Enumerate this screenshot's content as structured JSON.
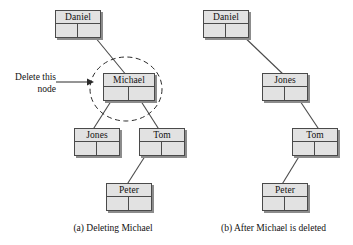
{
  "figure": {
    "background_color": "#ffffff",
    "node_fill_color": "#e2e2e2",
    "node_border_color": "#4a4a4a",
    "shadow_color": "#8c8c8c",
    "line_color": "#4a4a4a"
  },
  "annotation": {
    "line1": "Delete this",
    "line2": "node"
  },
  "panels": [
    {
      "id": "panel-a",
      "caption": "(a) Deleting Michael",
      "highlight": {
        "shape": "dashed-ellipse",
        "target": "Michael"
      },
      "nodes": [
        {
          "id": "daniel-a",
          "label": "Daniel",
          "x": 55,
          "y": 10
        },
        {
          "id": "michael-a",
          "label": "Michael",
          "x": 103,
          "y": 73
        },
        {
          "id": "jones-a",
          "label": "Jones",
          "x": 74,
          "y": 128
        },
        {
          "id": "tom-a",
          "label": "Tom",
          "x": 139,
          "y": 128
        },
        {
          "id": "peter-a",
          "label": "Peter",
          "x": 106,
          "y": 183
        }
      ],
      "edges": [
        {
          "from": "daniel-a",
          "fromSide": "right",
          "to": "michael-a",
          "toSide": "top"
        },
        {
          "from": "michael-a",
          "fromSide": "left",
          "to": "jones-a",
          "toSide": "top"
        },
        {
          "from": "michael-a",
          "fromSide": "right",
          "to": "tom-a",
          "toSide": "top"
        },
        {
          "from": "tom-a",
          "fromSide": "left",
          "to": "peter-a",
          "toSide": "top"
        }
      ]
    },
    {
      "id": "panel-b",
      "caption": "(b) After Michael is deleted",
      "highlight": null,
      "nodes": [
        {
          "id": "daniel-b",
          "label": "Daniel",
          "x": 203,
          "y": 10
        },
        {
          "id": "jones-b",
          "label": "Jones",
          "x": 262,
          "y": 73
        },
        {
          "id": "tom-b",
          "label": "Tom",
          "x": 292,
          "y": 128
        },
        {
          "id": "peter-b",
          "label": "Peter",
          "x": 262,
          "y": 183
        }
      ],
      "edges": [
        {
          "from": "daniel-b",
          "fromSide": "right",
          "to": "jones-b",
          "toSide": "top"
        },
        {
          "from": "jones-b",
          "fromSide": "right",
          "to": "tom-b",
          "toSide": "top"
        },
        {
          "from": "tom-b",
          "fromSide": "left",
          "to": "peter-b",
          "toSide": "top"
        }
      ]
    }
  ],
  "tree_structure": {
    "before": {
      "root": "Daniel",
      "edges": [
        {
          "parent": "Daniel",
          "child": "Michael",
          "side": "right"
        },
        {
          "parent": "Michael",
          "child": "Jones",
          "side": "left"
        },
        {
          "parent": "Michael",
          "child": "Tom",
          "side": "right"
        },
        {
          "parent": "Tom",
          "child": "Peter",
          "side": "left"
        }
      ]
    },
    "after": {
      "root": "Daniel",
      "edges": [
        {
          "parent": "Daniel",
          "child": "Jones",
          "side": "right"
        },
        {
          "parent": "Jones",
          "child": "Tom",
          "side": "right"
        },
        {
          "parent": "Tom",
          "child": "Peter",
          "side": "left"
        }
      ]
    }
  }
}
